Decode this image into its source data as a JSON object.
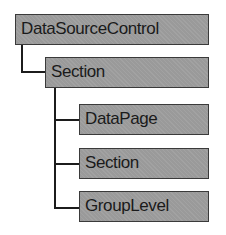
{
  "diagram": {
    "nodes": [
      {
        "id": "root",
        "label": "DataSourceControl"
      },
      {
        "id": "section1",
        "label": "Section"
      },
      {
        "id": "datapage",
        "label": "DataPage"
      },
      {
        "id": "section2",
        "label": "Section"
      },
      {
        "id": "grouplevel",
        "label": "GroupLevel"
      }
    ],
    "edges": [
      {
        "from": "root",
        "to": "section1"
      },
      {
        "from": "section1",
        "to": "datapage"
      },
      {
        "from": "section1",
        "to": "section2"
      },
      {
        "from": "section1",
        "to": "grouplevel"
      }
    ],
    "colors": {
      "node_fill": "#9a9a9a",
      "node_border": "#3a3a3a",
      "connector": "#1c1c1c"
    }
  }
}
